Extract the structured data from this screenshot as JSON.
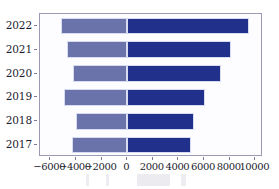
{
  "chart_data": {
    "type": "bar",
    "orientation": "horizontal",
    "title": "",
    "subtitle": "",
    "xlabel": "",
    "ylabel": "",
    "categories": [
      "2022",
      "2021",
      "2020",
      "2019",
      "2018",
      "2017"
    ],
    "series": [
      {
        "name": "negative",
        "color": "#6b74aa",
        "values": [
          -5200,
          -4700,
          -4200,
          -4900,
          -4000,
          -4300
        ]
      },
      {
        "name": "positive",
        "color": "#21308a",
        "values": [
          9500,
          8100,
          7300,
          6100,
          5200,
          5000
        ]
      }
    ],
    "xlim": [
      -6800,
      10600
    ],
    "ylim_categories_top_to_bottom": [
      "2022",
      "2021",
      "2020",
      "2019",
      "2018",
      "2017"
    ],
    "xticks": [
      -6000,
      -4000,
      -2000,
      0,
      2000,
      4000,
      6000,
      8000,
      10000
    ],
    "xtick_labels": [
      "−6000",
      "−4000",
      "−2000",
      "0",
      "2000",
      "4000",
      "6000",
      "8000",
      "10000"
    ],
    "yticks": [
      "2022",
      "2021",
      "2020",
      "2019",
      "2018",
      "2017"
    ],
    "grid": false,
    "legend": null,
    "annotations": []
  },
  "axis": {
    "x_tick_labels": [
      "−6000",
      "−4000",
      "−2000",
      "0",
      "2000",
      "4000",
      "6000",
      "8000",
      "10000"
    ],
    "y_tick_labels": [
      "2022",
      "2021",
      "2020",
      "2019",
      "2018",
      "2017"
    ]
  },
  "colors": {
    "bar_negative": "#6b74aa",
    "bar_positive": "#21308a",
    "frame": "#9a9ab4",
    "text": "#1c1c2e",
    "background": "#ffffff"
  }
}
